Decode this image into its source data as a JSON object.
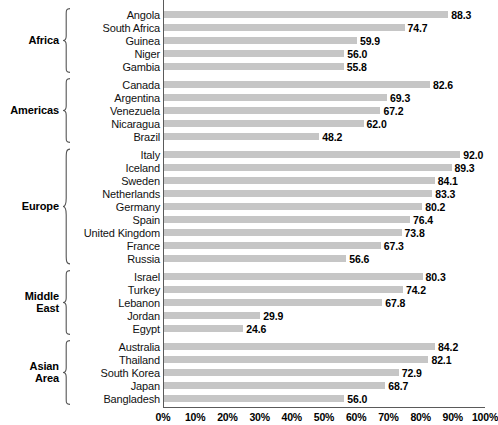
{
  "chart_data": {
    "type": "bar",
    "orientation": "horizontal",
    "title": "",
    "subtitle": "",
    "xlabel": "",
    "ylabel": "",
    "xlim": [
      0,
      100
    ],
    "xticks": [
      0,
      10,
      20,
      30,
      40,
      50,
      60,
      70,
      80,
      90,
      100
    ],
    "xtick_labels": [
      "0%",
      "10%",
      "20%",
      "30%",
      "40%",
      "50%",
      "60%",
      "70%",
      "80%",
      "90%",
      "100%"
    ],
    "grid": false,
    "legend": null,
    "value_format": "one-decimal",
    "bar_color": "#c6c6c6",
    "axis_color": "#5a5a5a",
    "text_color": "#111111",
    "groups": [
      {
        "label": "Africa",
        "label_lines": [
          "Africa"
        ],
        "categories": [
          "Angola",
          "South Africa",
          "Guinea",
          "Niger",
          "Gambia"
        ],
        "values": [
          88.3,
          74.7,
          59.9,
          56.0,
          55.8
        ],
        "value_labels": [
          "88.3",
          "74.7",
          "59.9",
          "56.0",
          "55.8"
        ]
      },
      {
        "label": "Americas",
        "label_lines": [
          "Americas"
        ],
        "categories": [
          "Canada",
          "Argentina",
          "Venezuela",
          "Nicaragua",
          "Brazil"
        ],
        "values": [
          82.6,
          69.3,
          67.2,
          62.0,
          48.2
        ],
        "value_labels": [
          "82.6",
          "69.3",
          "67.2",
          "62.0",
          "48.2"
        ]
      },
      {
        "label": "Europe",
        "label_lines": [
          "Europe"
        ],
        "categories": [
          "Italy",
          "Iceland",
          "Sweden",
          "Netherlands",
          "Germany",
          "Spain",
          "United Kingdom",
          "France",
          "Russia"
        ],
        "values": [
          92.0,
          89.3,
          84.1,
          83.3,
          80.2,
          76.4,
          73.8,
          67.3,
          56.6
        ],
        "value_labels": [
          "92.0",
          "89.3",
          "84.1",
          "83.3",
          "80.2",
          "76.4",
          "73.8",
          "67.3",
          "56.6"
        ]
      },
      {
        "label": "Middle East",
        "label_lines": [
          "Middle",
          "East"
        ],
        "categories": [
          "Israel",
          "Turkey",
          "Lebanon",
          "Jordan",
          "Egypt"
        ],
        "values": [
          80.3,
          74.2,
          67.8,
          29.9,
          24.6
        ],
        "value_labels": [
          "80.3",
          "74.2",
          "67.8",
          "29.9",
          "24.6"
        ]
      },
      {
        "label": "Asian Area",
        "label_lines": [
          "Asian",
          "Area"
        ],
        "categories": [
          "Australia",
          "Thailand",
          "South Korea",
          "Japan",
          "Bangladesh"
        ],
        "values": [
          84.2,
          82.1,
          72.9,
          68.7,
          56.0
        ],
        "value_labels": [
          "84.2",
          "82.1",
          "72.9",
          "68.7",
          "56.0"
        ]
      }
    ]
  }
}
